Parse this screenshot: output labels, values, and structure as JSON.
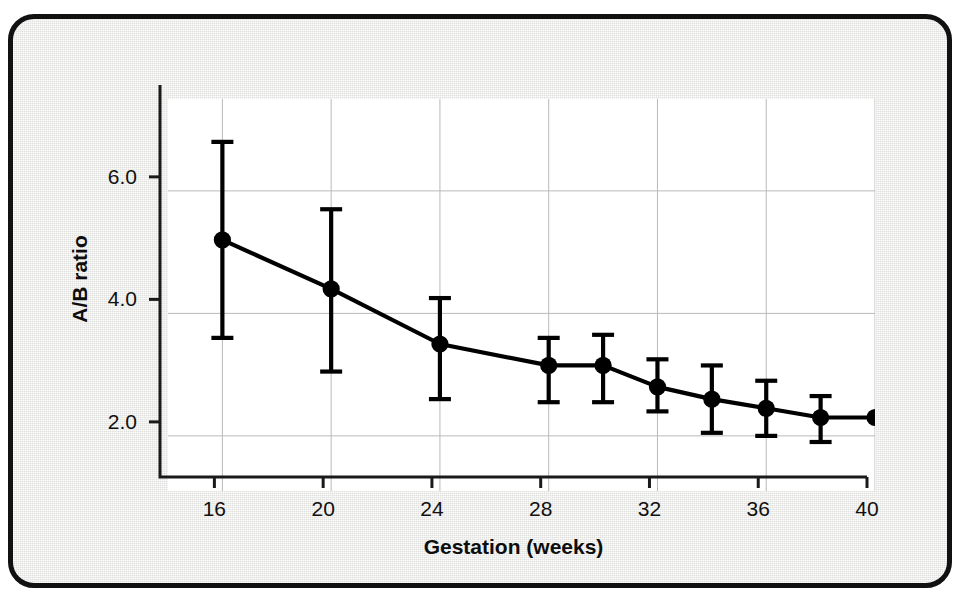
{
  "figure": {
    "background_color": "#e9e9e7",
    "frame_color": "#111111",
    "plot_background": "#ffffff",
    "series_color": "#000000",
    "grid_color": "#b9b9b9"
  },
  "chart_data": {
    "type": "line",
    "title": "",
    "subtitle": "",
    "xlabel": "Gestation (weeks)",
    "ylabel": "A/B ratio",
    "xlim": [
      14,
      40
    ],
    "ylim": [
      1.1,
      7.5
    ],
    "xticks": [
      16,
      20,
      24,
      28,
      32,
      36,
      40
    ],
    "xtick_labels": [
      "16",
      "20",
      "24",
      "28",
      "32",
      "36",
      "40"
    ],
    "yticks": [
      2.0,
      4.0,
      6.0
    ],
    "ytick_labels": [
      "2.0",
      "4.0",
      "6.0"
    ],
    "grid": "both",
    "legend": "none",
    "marker": "filled-circle",
    "error_bars": "vertical-capped",
    "x": [
      16,
      20,
      24,
      28,
      30,
      32,
      34,
      36,
      38,
      40
    ],
    "values": [
      5.2,
      4.4,
      3.5,
      3.15,
      3.15,
      2.8,
      2.6,
      2.45,
      2.3,
      2.3
    ],
    "err_upper": [
      6.8,
      5.7,
      4.25,
      3.6,
      3.65,
      3.25,
      3.15,
      2.9,
      2.65,
      null
    ],
    "err_lower": [
      3.6,
      3.05,
      2.6,
      2.55,
      2.55,
      2.4,
      2.05,
      2.0,
      1.9,
      null
    ],
    "points": [
      {
        "x": 16,
        "y": 5.2,
        "low": 3.6,
        "high": 6.8
      },
      {
        "x": 20,
        "y": 4.4,
        "low": 3.05,
        "high": 5.7
      },
      {
        "x": 24,
        "y": 3.5,
        "low": 2.6,
        "high": 4.25
      },
      {
        "x": 28,
        "y": 3.15,
        "low": 2.55,
        "high": 3.6
      },
      {
        "x": 30,
        "y": 3.15,
        "low": 2.55,
        "high": 3.65
      },
      {
        "x": 32,
        "y": 2.8,
        "low": 2.4,
        "high": 3.25
      },
      {
        "x": 34,
        "y": 2.6,
        "low": 2.05,
        "high": 3.15
      },
      {
        "x": 36,
        "y": 2.45,
        "low": 2.0,
        "high": 2.9
      },
      {
        "x": 38,
        "y": 2.3,
        "low": 1.9,
        "high": 2.65
      },
      {
        "x": 40,
        "y": 2.3,
        "low": null,
        "high": null
      }
    ]
  }
}
